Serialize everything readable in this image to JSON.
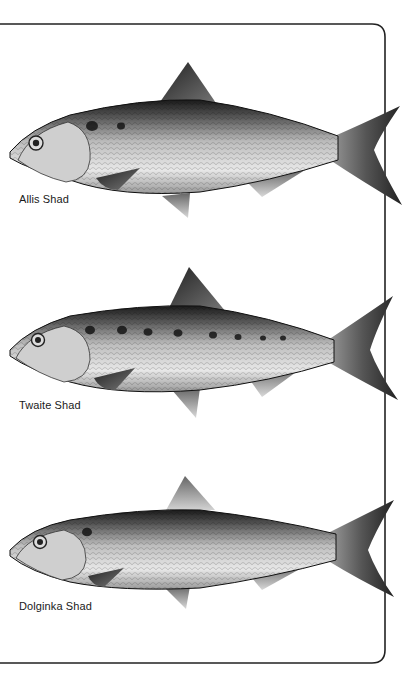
{
  "plate": {
    "frame_color": "#222222",
    "fish": [
      {
        "name": "Allis Shad",
        "spots": [
          {
            "x": 92,
            "y": 126,
            "r": 6
          },
          {
            "x": 121,
            "y": 126,
            "r": 4
          }
        ]
      },
      {
        "name": "Twaite Shad",
        "spots": [
          {
            "x": 90,
            "y": 330,
            "r": 5
          },
          {
            "x": 122,
            "y": 330,
            "r": 5
          },
          {
            "x": 148,
            "y": 332,
            "r": 4.5
          },
          {
            "x": 178,
            "y": 333,
            "r": 4.5
          },
          {
            "x": 213,
            "y": 335,
            "r": 4
          },
          {
            "x": 238,
            "y": 337,
            "r": 3.5
          },
          {
            "x": 263,
            "y": 338,
            "r": 3
          },
          {
            "x": 283,
            "y": 338,
            "r": 3
          }
        ]
      },
      {
        "name": "Dolginka Shad",
        "spots": [
          {
            "x": 87,
            "y": 532,
            "r": 5
          }
        ]
      }
    ]
  }
}
